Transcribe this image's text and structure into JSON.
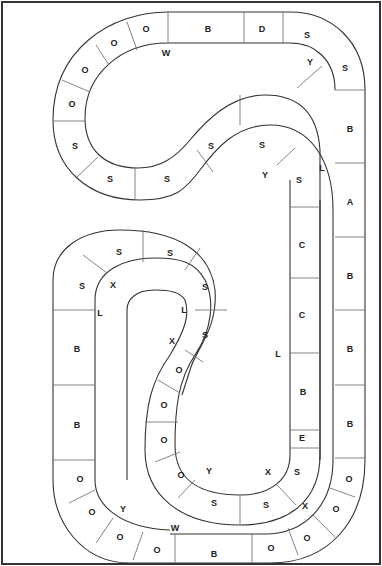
{
  "board": {
    "type": "race-track game board",
    "outer_track_spaces": [
      "B",
      "D",
      "S",
      "S",
      "B",
      "A",
      "B",
      "B",
      "B",
      "O",
      "O",
      "O",
      "O",
      "O",
      "B",
      "O",
      "O",
      "O",
      "O",
      "B",
      "B",
      "S",
      "S",
      "O",
      "O",
      "O",
      "O"
    ],
    "inner_track_spaces": [
      "S",
      "S",
      "S",
      "C",
      "C",
      "B",
      "E",
      "S",
      "S",
      "S",
      "O",
      "O",
      "O",
      "O",
      "X",
      "S",
      "S",
      "L",
      "S",
      "S",
      "S",
      "S",
      "B",
      "B",
      "O",
      "O"
    ],
    "spaces": [
      {
        "id": 0,
        "label": "O",
        "x": 146,
        "y": 29
      },
      {
        "id": 1,
        "label": "O",
        "x": 114,
        "y": 43
      },
      {
        "id": 2,
        "label": "O",
        "x": 85,
        "y": 70
      },
      {
        "id": 3,
        "label": "O",
        "x": 72,
        "y": 104
      },
      {
        "id": 4,
        "label": "S",
        "x": 75,
        "y": 146
      },
      {
        "id": 5,
        "label": "S",
        "x": 110,
        "y": 179
      },
      {
        "id": 6,
        "label": "S",
        "x": 167,
        "y": 179
      },
      {
        "id": 7,
        "label": "S",
        "x": 211,
        "y": 146
      },
      {
        "id": 8,
        "label": "S",
        "x": 262,
        "y": 145
      },
      {
        "id": 9,
        "label": "B",
        "x": 208,
        "y": 29
      },
      {
        "id": 10,
        "label": "D",
        "x": 262,
        "y": 29
      },
      {
        "id": 11,
        "label": "S",
        "x": 307,
        "y": 35
      },
      {
        "id": 12,
        "label": "S",
        "x": 345,
        "y": 68
      },
      {
        "id": 13,
        "label": "B",
        "x": 350,
        "y": 129
      },
      {
        "id": 14,
        "label": "A",
        "x": 350,
        "y": 202
      },
      {
        "id": 15,
        "label": "S",
        "x": 299,
        "y": 180
      },
      {
        "id": 16,
        "label": "C",
        "x": 302,
        "y": 245
      },
      {
        "id": 17,
        "label": "C",
        "x": 302,
        "y": 315
      },
      {
        "id": 18,
        "label": "B",
        "x": 350,
        "y": 276
      },
      {
        "id": 19,
        "label": "B",
        "x": 350,
        "y": 349
      },
      {
        "id": 20,
        "label": "B",
        "x": 303,
        "y": 392
      },
      {
        "id": 21,
        "label": "E",
        "x": 302,
        "y": 438
      },
      {
        "id": 22,
        "label": "B",
        "x": 350,
        "y": 424
      },
      {
        "id": 23,
        "label": "S",
        "x": 297,
        "y": 472
      },
      {
        "id": 24,
        "label": "O",
        "x": 349,
        "y": 479
      },
      {
        "id": 25,
        "label": "O",
        "x": 336,
        "y": 509
      },
      {
        "id": 26,
        "label": "O",
        "x": 307,
        "y": 538
      },
      {
        "id": 27,
        "label": "O",
        "x": 271,
        "y": 548
      },
      {
        "id": 28,
        "label": "B",
        "x": 214,
        "y": 554
      },
      {
        "id": 29,
        "label": "O",
        "x": 157,
        "y": 550
      },
      {
        "id": 30,
        "label": "O",
        "x": 120,
        "y": 537
      },
      {
        "id": 31,
        "label": "O",
        "x": 92,
        "y": 512
      },
      {
        "id": 32,
        "label": "O",
        "x": 80,
        "y": 479
      },
      {
        "id": 33,
        "label": "B",
        "x": 77,
        "y": 425
      },
      {
        "id": 34,
        "label": "B",
        "x": 77,
        "y": 349
      },
      {
        "id": 35,
        "label": "S",
        "x": 82,
        "y": 286
      },
      {
        "id": 36,
        "label": "S",
        "x": 119,
        "y": 252
      },
      {
        "id": 37,
        "label": "S",
        "x": 170,
        "y": 253
      },
      {
        "id": 38,
        "label": "S",
        "x": 205,
        "y": 287
      },
      {
        "id": 39,
        "label": "S",
        "x": 205,
        "y": 335
      },
      {
        "id": 40,
        "label": "O",
        "x": 179,
        "y": 370
      },
      {
        "id": 41,
        "label": "O",
        "x": 164,
        "y": 405
      },
      {
        "id": 42,
        "label": "O",
        "x": 164,
        "y": 440
      },
      {
        "id": 43,
        "label": "O",
        "x": 181,
        "y": 475
      },
      {
        "id": 44,
        "label": "S",
        "x": 214,
        "y": 503
      },
      {
        "id": 45,
        "label": "S",
        "x": 266,
        "y": 505
      }
    ],
    "markers": [
      {
        "label": "W",
        "x": 166,
        "y": 53
      },
      {
        "label": "Y",
        "x": 310,
        "y": 62
      },
      {
        "label": "L",
        "x": 322,
        "y": 168
      },
      {
        "label": "Y",
        "x": 265,
        "y": 175
      },
      {
        "label": "X",
        "x": 113,
        "y": 285
      },
      {
        "label": "L",
        "x": 100,
        "y": 313
      },
      {
        "label": "L",
        "x": 184,
        "y": 310
      },
      {
        "label": "X",
        "x": 172,
        "y": 341
      },
      {
        "label": "L",
        "x": 278,
        "y": 354
      },
      {
        "label": "Y",
        "x": 209,
        "y": 471
      },
      {
        "label": "X",
        "x": 268,
        "y": 472
      },
      {
        "label": "X",
        "x": 305,
        "y": 506
      },
      {
        "label": "Y",
        "x": 123,
        "y": 509
      },
      {
        "label": "W",
        "x": 175,
        "y": 528
      }
    ]
  }
}
